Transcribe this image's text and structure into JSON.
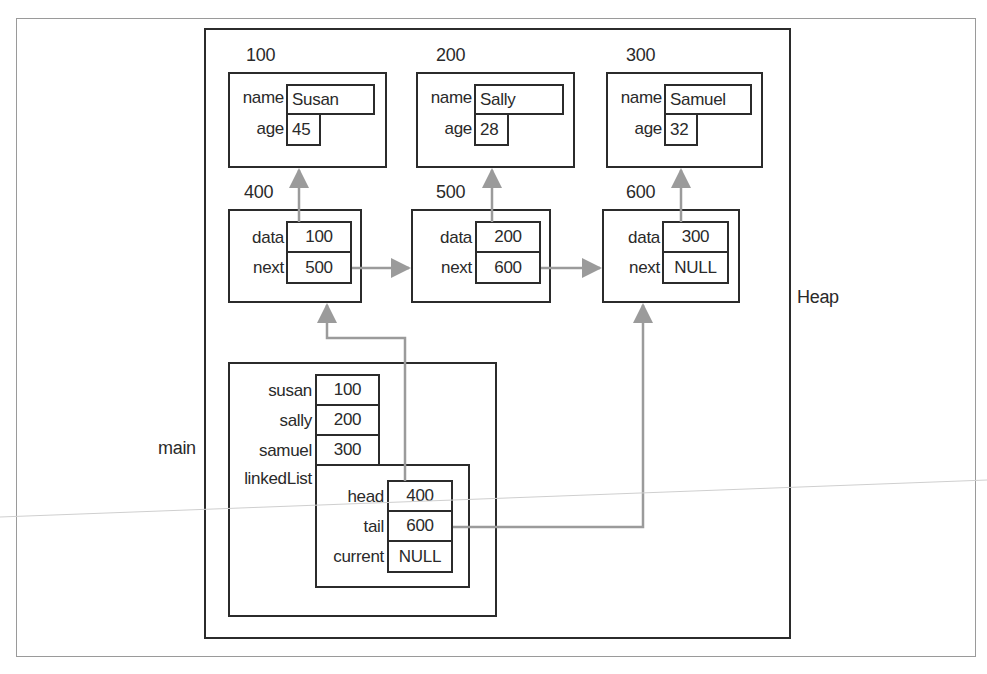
{
  "diagram": {
    "regions": {
      "heap_label": "Heap",
      "main_label": "main"
    },
    "persons": [
      {
        "address": "100",
        "name_label": "name",
        "age_label": "age",
        "name": "Susan",
        "age": "45"
      },
      {
        "address": "200",
        "name_label": "name",
        "age_label": "age",
        "name": "Sally",
        "age": "28"
      },
      {
        "address": "300",
        "name_label": "name",
        "age_label": "age",
        "name": "Samuel",
        "age": "32"
      }
    ],
    "nodes": [
      {
        "address": "400",
        "data_label": "data",
        "next_label": "next",
        "data": "100",
        "next": "500"
      },
      {
        "address": "500",
        "data_label": "data",
        "next_label": "next",
        "data": "200",
        "next": "600"
      },
      {
        "address": "600",
        "data_label": "data",
        "next_label": "next",
        "data": "300",
        "next": "NULL"
      }
    ],
    "main_vars": [
      {
        "label": "susan",
        "value": "100"
      },
      {
        "label": "sally",
        "value": "200"
      },
      {
        "label": "samuel",
        "value": "300"
      }
    ],
    "linked_list": {
      "label": "linkedList",
      "fields": [
        {
          "label": "head",
          "value": "400"
        },
        {
          "label": "tail",
          "value": "600"
        },
        {
          "label": "current",
          "value": "NULL"
        }
      ]
    },
    "colors": {
      "box_border": "#2b2b2b",
      "arrow": "#9b9b9b",
      "frame": "#9a9a9a"
    }
  }
}
